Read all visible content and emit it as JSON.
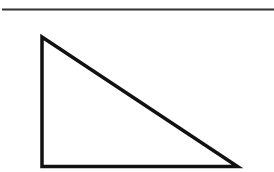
{
  "diagram": {
    "type": "geometry",
    "shape": "right-triangle",
    "stroke_color": "#111111",
    "rule_color": "#333333",
    "background": "#ffffff",
    "rule_line": {
      "x1": 2,
      "y1": 9.5,
      "x2": 274,
      "y2": 9.5,
      "width": 2
    },
    "triangle": {
      "vertices": [
        {
          "x": 42,
          "y": 37
        },
        {
          "x": 42,
          "y": 166.5
        },
        {
          "x": 237.5,
          "y": 166.5
        }
      ],
      "stroke_width": 3.5
    }
  }
}
